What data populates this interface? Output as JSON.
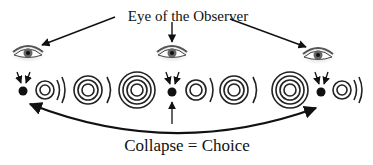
{
  "diagram": {
    "title": "Eye of the Observer",
    "caption": "Collapse = Choice",
    "cutoff_text": "",
    "colors": {
      "ink": "#111111",
      "background": "#ffffff",
      "eye_shade": "#777777"
    },
    "observers": [
      {
        "id": "left-eye",
        "x": 28,
        "y": 52
      },
      {
        "id": "center-eye",
        "x": 172,
        "y": 52
      },
      {
        "id": "right-eye",
        "x": 318,
        "y": 54
      }
    ],
    "collapse_points": [
      {
        "id": "left-dot",
        "x": 23,
        "y": 91
      },
      {
        "id": "center-dot",
        "x": 172,
        "y": 92
      },
      {
        "id": "right-dot",
        "x": 321,
        "y": 92
      }
    ],
    "wave_packets": [
      {
        "x": 45,
        "y": 90,
        "rings": 2,
        "arcs": 2
      },
      {
        "x": 88,
        "y": 90,
        "rings": 2,
        "arcs": 1
      },
      {
        "x": 137,
        "y": 90,
        "rings": 3,
        "arcs": 0
      },
      {
        "x": 196,
        "y": 90,
        "rings": 2,
        "arcs": 1
      },
      {
        "x": 236,
        "y": 90,
        "rings": 2,
        "arcs": 1
      },
      {
        "x": 288,
        "y": 90,
        "rings": 3,
        "arcs": 0
      },
      {
        "x": 342,
        "y": 90,
        "rings": 2,
        "arcs": 2
      }
    ]
  }
}
